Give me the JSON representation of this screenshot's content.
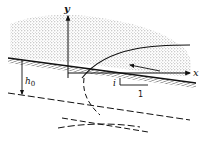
{
  "diagram": {
    "type": "physics/fluid schematic",
    "labels": {
      "y_axis": "y",
      "x_axis": "x",
      "depth": "h",
      "depth_subscript": "0",
      "slope_symbol": "i",
      "slope_run": "1"
    },
    "colors": {
      "ink": "#111111",
      "stipple": "#9a9a9a",
      "background": "#ffffff"
    }
  }
}
